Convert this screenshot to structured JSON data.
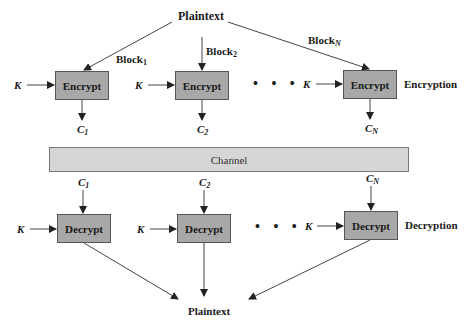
{
  "colors": {
    "box_fill": "#a8a8a8",
    "channel_fill": "#d6d6d6",
    "line": "#333333"
  },
  "top": {
    "plaintext": "Plaintext",
    "blocks": [
      {
        "base": "Block",
        "sub": "1"
      },
      {
        "base": "Block",
        "sub": "2"
      },
      {
        "base": "Block",
        "sub": "N"
      }
    ]
  },
  "encryption": {
    "section_label": "Encryption",
    "key_label": "K",
    "box_label": "Encrypt",
    "outputs": [
      {
        "base": "C",
        "sub": "1"
      },
      {
        "base": "C",
        "sub": "2"
      },
      {
        "base": "C",
        "sub": "N"
      }
    ],
    "ellipsis": "• • •"
  },
  "channel": {
    "label": "Channel"
  },
  "decryption": {
    "section_label": "Decryption",
    "key_label": "K",
    "box_label": "Decrypt",
    "inputs": [
      {
        "base": "C",
        "sub": "1"
      },
      {
        "base": "C",
        "sub": "2"
      },
      {
        "base": "C",
        "sub": "N"
      }
    ],
    "ellipsis": "• • •"
  },
  "bottom": {
    "plaintext": "Plaintext"
  }
}
